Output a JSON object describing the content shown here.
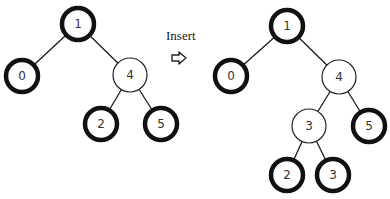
{
  "transition": {
    "label": "Insert",
    "icon": "right-arrow-outline-icon"
  },
  "trees": [
    {
      "name": "before",
      "nodes": [
        {
          "id": "a1",
          "label": "1",
          "x": 78,
          "y": 24,
          "style": "thick"
        },
        {
          "id": "a0",
          "label": "0",
          "x": 22,
          "y": 76,
          "style": "thick"
        },
        {
          "id": "a4",
          "label": "4",
          "x": 130,
          "y": 75,
          "style": "thin"
        },
        {
          "id": "a2",
          "label": "2",
          "x": 101,
          "y": 124,
          "style": "thick"
        },
        {
          "id": "a5",
          "label": "5",
          "x": 161,
          "y": 124,
          "style": "thick"
        }
      ],
      "edges": [
        [
          "a1",
          "a0"
        ],
        [
          "a1",
          "a4"
        ],
        [
          "a4",
          "a2"
        ],
        [
          "a4",
          "a5"
        ]
      ]
    },
    {
      "name": "after",
      "nodes": [
        {
          "id": "b1",
          "label": "1",
          "x": 287,
          "y": 26,
          "style": "thick"
        },
        {
          "id": "b0",
          "label": "0",
          "x": 231,
          "y": 76,
          "style": "thick"
        },
        {
          "id": "b4",
          "label": "4",
          "x": 339,
          "y": 77,
          "style": "thin"
        },
        {
          "id": "b3",
          "label": "3",
          "x": 309,
          "y": 126,
          "style": "thin"
        },
        {
          "id": "b5",
          "label": "5",
          "x": 369,
          "y": 126,
          "style": "thick"
        },
        {
          "id": "b2",
          "label": "2",
          "x": 287,
          "y": 175,
          "style": "thick"
        },
        {
          "id": "b3b",
          "label": "3",
          "x": 333,
          "y": 175,
          "style": "thick"
        }
      ],
      "edges": [
        [
          "b1",
          "b0"
        ],
        [
          "b1",
          "b4"
        ],
        [
          "b4",
          "b3"
        ],
        [
          "b4",
          "b5"
        ],
        [
          "b3",
          "b2"
        ],
        [
          "b3",
          "b3b"
        ]
      ]
    }
  ]
}
